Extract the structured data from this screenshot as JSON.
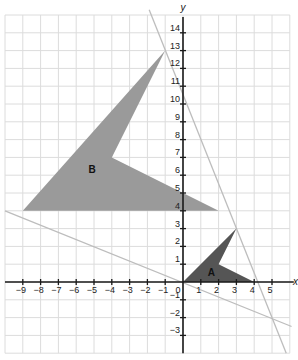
{
  "figure": {
    "x_axis_label": "x",
    "y_axis_label": "y",
    "x_range": [
      -10,
      6
    ],
    "y_range": [
      -4,
      15
    ],
    "x_tick_labels": [
      "-9",
      "-8",
      "-7",
      "-6",
      "-5",
      "-4",
      "-3",
      "-2",
      "-1",
      "0",
      "1",
      "2",
      "3",
      "4",
      "5"
    ],
    "y_tick_labels": [
      "14",
      "13",
      "12",
      "11",
      "10",
      "9",
      "8",
      "7",
      "6",
      "5",
      "4",
      "3",
      "2",
      "1",
      "-1",
      "-2",
      "-3"
    ],
    "shapes": [
      {
        "label": "A",
        "vertices": [
          [
            0,
            0
          ],
          [
            3,
            3
          ],
          [
            2,
            1
          ],
          [
            4,
            0
          ]
        ],
        "color": "#555555"
      },
      {
        "label": "B",
        "vertices": [
          [
            -9,
            4
          ],
          [
            -1,
            13
          ],
          [
            -4,
            7
          ],
          [
            2,
            4
          ]
        ],
        "color": "#9a9a9a"
      }
    ],
    "lines": [
      {
        "name": "line-through-A3-3-and-B-1-13",
        "from": [
          -1.9,
          15.3
        ],
        "to": [
          5.8,
          -4.0
        ],
        "color": "#bdbdbd"
      },
      {
        "name": "line-through-A0-0-and-B-9-4",
        "from": [
          -10,
          4.0
        ],
        "to": [
          6.1,
          -2.5
        ],
        "color": "#bdbdbd"
      }
    ],
    "colors": {
      "grid": "#dcdcdc",
      "axis": "#1a1a1a",
      "background": "#ffffff"
    }
  }
}
